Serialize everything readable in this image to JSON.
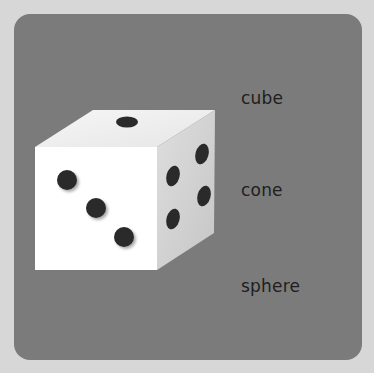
{
  "colors": {
    "outer_background": "#d7d7d7",
    "panel_background": "#7b7b7b",
    "die_front": "#ffffff",
    "die_top": "#f1f1f1",
    "die_side": "#d2d2d2",
    "pip": "#2a2a2a",
    "label_text": "#1e1e1e"
  },
  "die": {
    "top_face_pips": 1,
    "front_face_pips": 3,
    "side_face_pips": 4
  },
  "options": [
    {
      "label": "cube"
    },
    {
      "label": "cone"
    },
    {
      "label": "sphere"
    }
  ]
}
